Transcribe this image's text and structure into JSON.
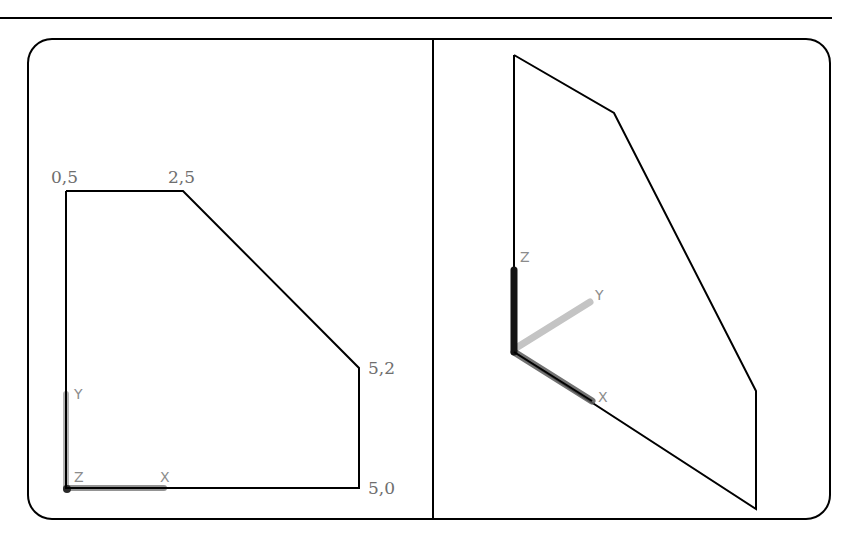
{
  "figure": {
    "left_view": {
      "vertex_labels": [
        "0,5",
        "2,5",
        "5,2",
        "5,0"
      ],
      "axis_labels": {
        "x": "X",
        "y": "Y",
        "z": "Z"
      }
    },
    "right_view": {
      "axis_labels": {
        "x": "X",
        "y": "Y",
        "z": "Z"
      }
    }
  },
  "colors": {
    "outline": "#000000",
    "label": "#6e6e6e",
    "axis_gray": "#8c8c8c",
    "axis_dark": "#1a1a1a",
    "axis_light": "#bdbdbd"
  }
}
